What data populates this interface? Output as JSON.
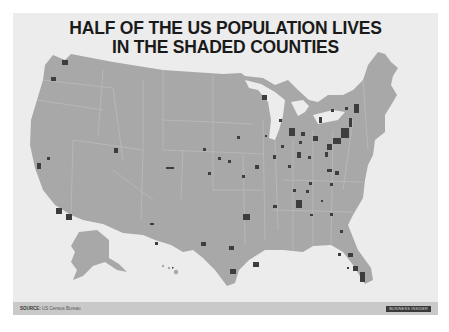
{
  "title": {
    "line1": "HALF OF THE US POPULATION LIVES",
    "line2": "IN THE SHADED COUNTIES"
  },
  "footer": {
    "source_label": "SOURCE:",
    "source_value": "US Census Bureau",
    "brand": "BUSINESS INSIDER"
  },
  "map": {
    "subject": "United States counties",
    "regions_shown": [
      "Contiguous US",
      "Alaska",
      "Hawaii"
    ],
    "shaded_meaning": "Counties containing half of US population",
    "colors": {
      "background": "#ececec",
      "land": "#a8a8a8",
      "shaded_county": "#3d3d3d",
      "borders": "#b8b8b8"
    }
  }
}
